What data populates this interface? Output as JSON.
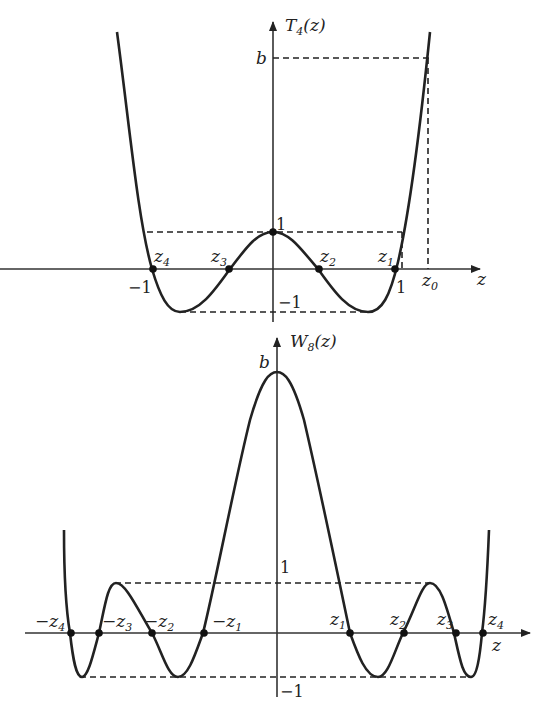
{
  "figures": [
    {
      "id": "top",
      "y_axis_label": "T",
      "y_axis_sub": "4",
      "y_axis_arg": "(z)",
      "x_axis_label": "z",
      "b_label": "b",
      "one_label": "1",
      "neg_one_label": "−1",
      "x_neg_one": "−1",
      "x_one": "1",
      "z0_label": "z",
      "z0_sub": "0",
      "roots": [
        {
          "name": "z",
          "sub": "4"
        },
        {
          "name": "z",
          "sub": "3"
        },
        {
          "name": "z",
          "sub": "2"
        },
        {
          "name": "z",
          "sub": "1"
        }
      ]
    },
    {
      "id": "bottom",
      "y_axis_label": "W",
      "y_axis_sub": "8",
      "y_axis_arg": "(z)",
      "x_axis_label": "z",
      "b_label": "b",
      "one_label": "1",
      "neg_one_label": "−1",
      "roots": [
        {
          "name": "−z",
          "sub": "4"
        },
        {
          "name": "−z",
          "sub": "3"
        },
        {
          "name": "−z",
          "sub": "2"
        },
        {
          "name": "−z",
          "sub": "1"
        },
        {
          "name": "z",
          "sub": "1"
        },
        {
          "name": "z",
          "sub": "2"
        },
        {
          "name": "z",
          "sub": "3"
        },
        {
          "name": "z",
          "sub": "4"
        }
      ]
    }
  ]
}
